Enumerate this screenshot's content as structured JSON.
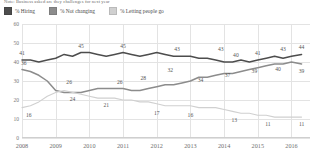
{
  "chart_title": "Note: Business asked are they challenges for next year",
  "legend": {
    "position": "top-left",
    "items": [
      {
        "label": "% Hiring",
        "color": "#4d4d4d",
        "key": "hiring"
      },
      {
        "label": "% Not changing",
        "color": "#8c8c8c",
        "key": "not_changing"
      },
      {
        "label": "% Letting people go",
        "color": "#d0d0d0",
        "key": "letting_go"
      }
    ]
  },
  "chart_data": {
    "type": "line",
    "title": "Note: Business asked are they challenges for next year",
    "xlabel": "",
    "ylabel": "",
    "ylim": [
      0,
      60
    ],
    "yticks": [
      0,
      10,
      20,
      30,
      40,
      50,
      60
    ],
    "xticks": [
      "2008",
      "2009",
      "2010",
      "2011",
      "2012",
      "2013",
      "2014",
      "2015",
      "2016"
    ],
    "grid": true,
    "legend_position": "top-left",
    "x": [
      2008.0,
      2008.25,
      2008.5,
      2008.75,
      2009.0,
      2009.25,
      2009.5,
      2009.75,
      2010.0,
      2010.25,
      2010.5,
      2010.75,
      2011.0,
      2011.25,
      2011.5,
      2011.75,
      2012.0,
      2012.25,
      2012.5,
      2012.75,
      2013.0,
      2013.25,
      2013.5,
      2013.75,
      2014.0,
      2014.25,
      2014.5,
      2014.75,
      2015.0,
      2015.25,
      2015.5,
      2015.75,
      2016.0,
      2016.3
    ],
    "series": [
      {
        "name": "% Hiring",
        "color": "#4d4d4d",
        "values": [
          41,
          41,
          40,
          41,
          42,
          44,
          43,
          45,
          45,
          44,
          43,
          44,
          45,
          44,
          43,
          44,
          45,
          44,
          43,
          43,
          43,
          42,
          42,
          41,
          40,
          40,
          41,
          40,
          41,
          42,
          43,
          42,
          43,
          44
        ]
      },
      {
        "name": "% Not changing",
        "color": "#8c8c8c",
        "values": [
          36,
          35,
          33,
          30,
          25,
          24,
          24,
          24,
          25,
          26,
          26,
          26,
          26,
          25,
          25,
          26,
          27,
          28,
          28,
          29,
          30,
          32,
          32,
          33,
          34,
          34,
          35,
          36,
          37,
          38,
          39,
          39,
          40,
          39
        ]
      },
      {
        "name": "% Letting people go",
        "color": "#d0d0d0",
        "values": [
          16,
          17,
          19,
          22,
          24,
          25,
          24,
          23,
          22,
          21,
          21,
          21,
          20,
          20,
          19,
          19,
          18,
          17,
          17,
          17,
          17,
          16,
          16,
          16,
          15,
          14,
          13,
          13,
          12,
          12,
          11,
          11,
          11,
          11
        ]
      }
    ],
    "point_labels": [
      {
        "series": "% Hiring",
        "x": 2008.0,
        "value": 41,
        "pos": "above"
      },
      {
        "series": "% Hiring",
        "x": 2009.75,
        "value": 45,
        "pos": "above"
      },
      {
        "series": "% Hiring",
        "x": 2011.0,
        "value": 45,
        "pos": "above"
      },
      {
        "series": "% Hiring",
        "x": 2012.6,
        "value": 43,
        "pos": "above"
      },
      {
        "series": "% Hiring",
        "x": 2013.9,
        "value": 43,
        "pos": "above"
      },
      {
        "series": "% Hiring",
        "x": 2014.35,
        "value": 40,
        "pos": "above"
      },
      {
        "series": "% Hiring",
        "x": 2015.0,
        "value": 41,
        "pos": "above"
      },
      {
        "series": "% Hiring",
        "x": 2015.75,
        "value": 43,
        "pos": "above"
      },
      {
        "series": "% Hiring",
        "x": 2016.3,
        "value": 44,
        "pos": "above"
      },
      {
        "series": "% Not changing",
        "x": 2008.05,
        "value": 36,
        "pos": "above"
      },
      {
        "series": "% Not changing",
        "x": 2009.4,
        "value": 26,
        "pos": "above"
      },
      {
        "series": "% Not changing",
        "x": 2009.5,
        "value": 24,
        "pos": "below"
      },
      {
        "series": "% Not changing",
        "x": 2010.9,
        "value": 26,
        "pos": "above"
      },
      {
        "series": "% Not changing",
        "x": 2011.6,
        "value": 28,
        "pos": "above"
      },
      {
        "series": "% Not changing",
        "x": 2012.4,
        "value": 32,
        "pos": "above"
      },
      {
        "series": "% Not changing",
        "x": 2013.3,
        "value": 34,
        "pos": "below"
      },
      {
        "series": "% Not changing",
        "x": 2014.1,
        "value": 37,
        "pos": "below"
      },
      {
        "series": "% Not changing",
        "x": 2014.9,
        "value": 39,
        "pos": "below"
      },
      {
        "series": "% Not changing",
        "x": 2015.6,
        "value": 40,
        "pos": "below"
      },
      {
        "series": "% Not changing",
        "x": 2016.3,
        "value": 39,
        "pos": "below"
      },
      {
        "series": "% Letting people go",
        "x": 2008.2,
        "value": 16,
        "pos": "below"
      },
      {
        "series": "% Letting people go",
        "x": 2010.5,
        "value": 21,
        "pos": "below"
      },
      {
        "series": "% Letting people go",
        "x": 2012.0,
        "value": 17,
        "pos": "below"
      },
      {
        "series": "% Letting people go",
        "x": 2013.0,
        "value": 16,
        "pos": "below"
      },
      {
        "series": "% Letting people go",
        "x": 2014.3,
        "value": 13,
        "pos": "below"
      },
      {
        "series": "% Letting people go",
        "x": 2015.3,
        "value": 11,
        "pos": "below"
      },
      {
        "series": "% Letting people go",
        "x": 2016.3,
        "value": 11,
        "pos": "below"
      }
    ]
  }
}
